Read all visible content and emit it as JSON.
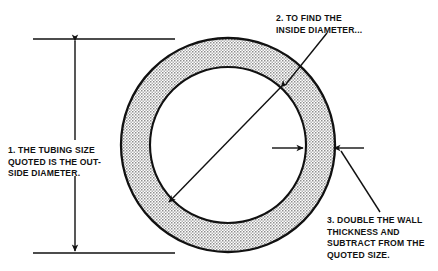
{
  "figure": {
    "kind": "engineering-diagram",
    "colors": {
      "background": "#ffffff",
      "line": "#111111",
      "wall_fill": "#c9c9c9",
      "bore_fill": "#ffffff"
    }
  },
  "callouts": [
    {
      "id": "outside-diameter-note",
      "number": "1.",
      "text": "1. THE TUBING SIZE\nQUOTED IS THE OUT-\nSIDE DIAMETER."
    },
    {
      "id": "inside-diameter-note",
      "number": "2.",
      "text": "2. TO FIND THE\nINSIDE DIAMETER..."
    },
    {
      "id": "wall-thickness-note",
      "number": "3.",
      "text": "3.  DOUBLE THE WALL\nTHICKNESS AND\nSUBTRACT FROM THE\nQUOTED SIZE."
    }
  ],
  "geometry": {
    "center": {
      "x": 228,
      "y": 145
    },
    "outer_radius": 107,
    "inner_radius": 78,
    "wall_thickness": 29,
    "outside_diameter_dimension": {
      "line_x": 75,
      "top_y": 39,
      "bottom_y": 253,
      "extension_top": {
        "x1": 33,
        "x2": 175,
        "y": 39
      },
      "extension_bottom": {
        "x1": 33,
        "x2": 175,
        "y": 253
      },
      "arrowheads": [
        "up",
        "down"
      ]
    },
    "inside_diameter_dimension": {
      "from": {
        "x": 283,
        "y": 85
      },
      "to": {
        "x": 167,
        "y": 204
      },
      "arrowheads": [
        "both"
      ]
    },
    "wall_thickness_dimension": {
      "y": 148,
      "left_arrow": {
        "from_x": 272,
        "to_x": 303
      },
      "right_arrow": {
        "from_x": 364,
        "to_x": 334
      },
      "arrowheads": [
        "right",
        "left"
      ]
    },
    "leader_lines": [
      {
        "id": "leader-inside-diameter",
        "from": {
          "x": 327,
          "y": 33
        },
        "to": {
          "x": 284,
          "y": 86
        }
      },
      {
        "id": "leader-wall-thickness",
        "from": {
          "x": 380,
          "y": 213
        },
        "to": {
          "x": 340,
          "y": 150
        }
      }
    ]
  }
}
